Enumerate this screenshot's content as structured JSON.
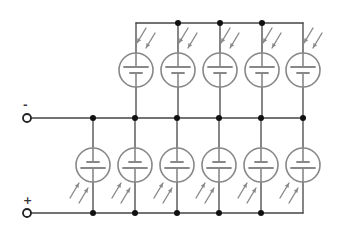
{
  "diagram": {
    "terminals": {
      "negative": {
        "label": "-",
        "x": 27,
        "y": 118
      },
      "positive": {
        "label": "+",
        "x": 27,
        "y": 213
      }
    },
    "colors": {
      "wire": "#444444",
      "cell": "#888888",
      "arrow": "#8a8a8a",
      "node": "#111111"
    },
    "top_row": {
      "bus_top_y": 23,
      "bus_bottom_y": 118,
      "cell_center_y": 70,
      "cells_x": [
        136,
        178,
        220,
        262,
        303
      ],
      "nodes_top": [
        178,
        220,
        262
      ],
      "orientation": "light-from-top"
    },
    "bottom_row": {
      "bus_top_y": 118,
      "bus_bottom_y": 213,
      "cell_center_y": 165,
      "cells_x": [
        93,
        135,
        177,
        219,
        261,
        303
      ],
      "nodes_top": [
        93,
        135,
        177,
        219,
        261,
        303
      ],
      "nodes_bottom": [
        93,
        135,
        177,
        219,
        261
      ],
      "orientation": "light-from-bottom"
    }
  }
}
